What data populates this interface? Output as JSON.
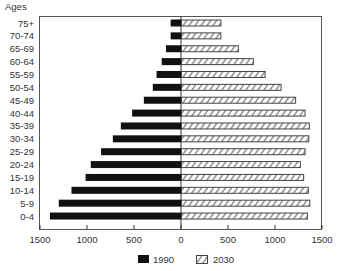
{
  "chart_data": {
    "type": "bar",
    "orientation": "horizontal",
    "subtype": "population-pyramid",
    "title": "",
    "ylabel": "Ages",
    "xlabel": "",
    "categories": [
      "75+",
      "70-74",
      "65-69",
      "60-64",
      "55-59",
      "50-54",
      "45-49",
      "40-44",
      "35-39",
      "30-34",
      "25-29",
      "20-24",
      "15-19",
      "10-14",
      "5-9",
      "0-4"
    ],
    "series": [
      {
        "name": "1990",
        "side": "left",
        "fill": "solid",
        "color": "#111111",
        "values": [
          110,
          110,
          160,
          205,
          260,
          300,
          395,
          520,
          640,
          725,
          850,
          960,
          1015,
          1165,
          1300,
          1395
        ]
      },
      {
        "name": "2030",
        "side": "right",
        "fill": "hatched",
        "color": "#333333",
        "values": [
          430,
          430,
          615,
          775,
          900,
          1070,
          1225,
          1325,
          1370,
          1365,
          1325,
          1275,
          1310,
          1360,
          1375,
          1350
        ]
      }
    ],
    "xticks": [
      "1500",
      "1000",
      "500",
      "0",
      "500",
      "1000",
      "1500"
    ],
    "xlim": [
      -1500,
      1500
    ],
    "grid": false,
    "legend_position": "bottom-center"
  },
  "legend": [
    {
      "label": "1990",
      "style": "solid"
    },
    {
      "label": "2030",
      "style": "hatched"
    }
  ]
}
